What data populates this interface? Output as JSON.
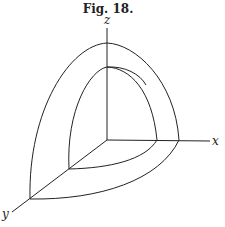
{
  "figure": {
    "caption": "Fig. 18.",
    "axes": {
      "x_label": "x",
      "y_label": "y",
      "z_label": "z"
    }
  }
}
